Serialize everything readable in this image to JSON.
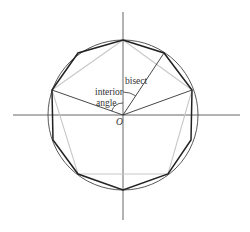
{
  "labels": {
    "interior_line1": "interior",
    "interior_line2": "angle",
    "bisect": "bisect",
    "origin": "O"
  },
  "colors": {
    "axis": "#555555",
    "circle": "#444444",
    "decagon": "#222222",
    "pentagon": "#c8c8c8",
    "radius": "#333333"
  },
  "geometry": {
    "center": [
      123,
      115
    ],
    "radius": 75,
    "axis_h": [
      13,
      240
    ],
    "axis_v": [
      12,
      220
    ],
    "pentagon_vertices": [
      [
        123,
        40
      ],
      [
        192,
        90
      ],
      [
        168,
        174
      ],
      [
        78,
        174
      ],
      [
        52,
        90
      ]
    ],
    "decagon_vertices": [
      [
        123,
        40
      ],
      [
        164,
        53
      ],
      [
        192,
        90
      ],
      [
        191,
        140
      ],
      [
        168,
        174
      ],
      [
        123,
        190
      ],
      [
        78,
        174
      ],
      [
        53,
        140
      ],
      [
        52,
        90
      ],
      [
        78,
        53
      ]
    ]
  }
}
